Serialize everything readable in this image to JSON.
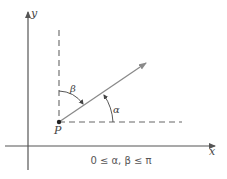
{
  "diagram": {
    "axes": {
      "x_label": "x",
      "y_label": "y"
    },
    "point": {
      "label": "P"
    },
    "angles": {
      "alpha_label": "α",
      "beta_label": "β"
    },
    "caption": "0 ≤ α, β ≤ π",
    "colors": {
      "axis": "#555555",
      "vector": "#8a8a8a",
      "dashed": "#666666",
      "text": "#444444"
    }
  }
}
